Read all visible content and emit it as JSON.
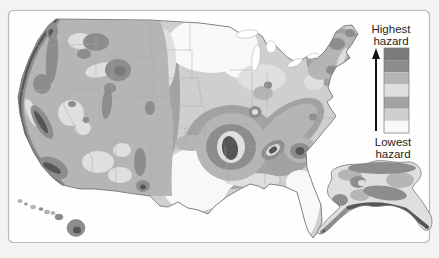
{
  "figure": {
    "kind": "seismic-hazard-map",
    "insets": [
      "conterminous-united-states",
      "alaska",
      "hawaii"
    ]
  },
  "legend": {
    "highest_line1": "Highest",
    "highest_line2": "hazard",
    "lowest_line1": "Lowest",
    "lowest_line2": "hazard",
    "arrow_icon": "up-arrow",
    "bands_top_to_bottom": [
      "#7b7b79",
      "#8d8d8b",
      "#b5b5b3",
      "#dfdfdd",
      "#a2a2a0",
      "#cfcfcd",
      "#f8f8f6"
    ]
  },
  "palette": {
    "L1": "#f8f8f6",
    "L2": "#cfcfcd",
    "L3": "#a2a2a0",
    "L4": "#dfdfdd",
    "L5": "#b5b5b3",
    "L6": "#8d8d8b",
    "L7": "#7b7b79",
    "darkest": "#565654",
    "outline": "#777775",
    "state_line": "#a8a8a6",
    "water": "#ffffff",
    "frame_border": "#b8b8b6",
    "page_bg": "#f3f3f1",
    "panel_bg": "#fefefc",
    "text": "#1f1f1d",
    "arrow": "#141414"
  }
}
